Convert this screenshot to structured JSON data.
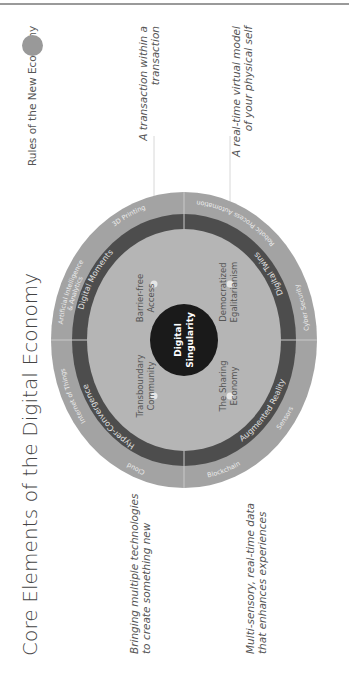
{
  "title": "Core Elements of the Digital Economy",
  "legend": {
    "label": "Rules of the New Economy",
    "dot_color": "#999999"
  },
  "colors": {
    "outer_ring": "#a3a3a3",
    "middle_ring": "#4d4d4d",
    "inner_disc": "#b5b5b5",
    "core": "#1a1a1a",
    "ring_text": "#e8e8e8",
    "core_text": "#ffffff",
    "inner_text": "#555555"
  },
  "core": {
    "line1": "Digital",
    "line2": "Singularity"
  },
  "inner_quadrants": [
    {
      "line1": "Barrier-free",
      "line2": "Access"
    },
    {
      "line1": "Democratized",
      "line2": "Egalitarianism"
    },
    {
      "line1": "The Sharing",
      "line2": "Economy"
    },
    {
      "line1": "Transboundary",
      "line2": "Community"
    }
  ],
  "middle_ring": [
    "Digital Moments",
    "Digital Twins",
    "Augmented Reality",
    "Hyper-Convergence"
  ],
  "outer_ring": [
    "Artificial Intelligence",
    "& Analytics",
    "3D Printing",
    "Robotic Process Automation",
    "Cyber Security",
    "Sensors",
    "Blockchain",
    "Cloud",
    "Internet of Things"
  ],
  "annotations": {
    "digital_moments": {
      "line1": "A transaction within a",
      "line2": "transaction"
    },
    "digital_twins": {
      "line1": "A real-time virtual model",
      "line2": "of your physical self"
    },
    "hyper_convergence": {
      "line1": "Bringing multiple technologies",
      "line2": "to create something new"
    },
    "augmented_reality": {
      "line1": "Multi-sensory, real-time data",
      "line2": "that enhances experiences"
    }
  }
}
